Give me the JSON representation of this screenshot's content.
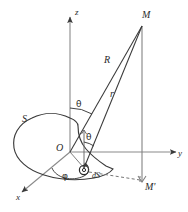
{
  "figure": {
    "type": "geometry-diagram",
    "background_color": "#ffffff",
    "stroke_color": "#3a3a3a",
    "text_color": "#2b2b2b",
    "width": 188,
    "height": 212
  },
  "axes": {
    "z": {
      "label": "z",
      "direction": "up",
      "arrow": true
    },
    "y": {
      "label": "y",
      "direction": "right",
      "arrow": true
    },
    "x": {
      "label": "x",
      "direction": "down-left",
      "arrow": true
    },
    "origin": {
      "label": "O"
    }
  },
  "points": {
    "field_point": {
      "label": "M",
      "description": "field point above surface"
    },
    "projection_point": {
      "label": "M'",
      "description": "projection of M onto xy-plane"
    }
  },
  "surface": {
    "label": "S",
    "element_label": "dS",
    "element_description": "infinitesimal surface element"
  },
  "distances": {
    "from_origin": {
      "label": "R",
      "description": "distance from O to M"
    },
    "from_element": {
      "label": "r",
      "description": "distance from dS to M"
    }
  },
  "angles": {
    "polar_at_origin": {
      "label": "θ",
      "description": "angle between z-axis and R"
    },
    "polar_at_element": {
      "label": "θ",
      "description": "angle between surface normal and r"
    },
    "azimuth": {
      "label": "φ",
      "description": "azimuthal angle in xy-plane from x-axis"
    }
  },
  "lines": {
    "dashed": [
      {
        "name": "element-to-Mprime",
        "style": "dashed"
      },
      {
        "name": "Mprime-vertical-tick",
        "style": "dashed"
      }
    ]
  }
}
